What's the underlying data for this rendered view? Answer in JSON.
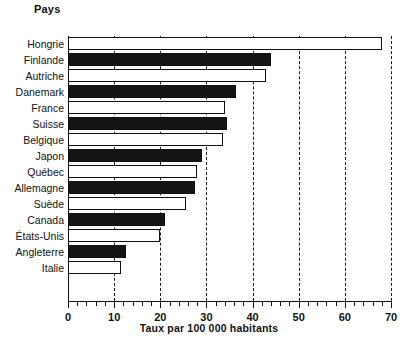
{
  "figure": {
    "category_axis_title": "Pays",
    "value_axis_caption": "Taux par 100 000 habitants"
  },
  "chart_data": {
    "type": "bar",
    "orientation": "horizontal",
    "title": "",
    "xlabel": "Taux par 100 000 habitants",
    "ylabel": "Pays",
    "xlim": [
      0,
      70
    ],
    "xticks": [
      0,
      10,
      20,
      30,
      40,
      50,
      60,
      70
    ],
    "xtick_labels": [
      "0",
      "10",
      "20",
      "30",
      "40",
      "50",
      "60",
      "70"
    ],
    "minor_tick_step": 2,
    "grid": "vertical dashed gridlines at 10, 20, 30, 40, 50, 60, 70",
    "legend": "none",
    "categories": [
      "Hongrie",
      "Finlande",
      "Autriche",
      "Danemark",
      "France",
      "Suisse",
      "Belgique",
      "Japon",
      "Québec",
      "Allemagne",
      "Suède",
      "Canada",
      "États-Unis",
      "Angleterre",
      "Italie"
    ],
    "values": [
      68,
      44,
      43,
      36.5,
      34,
      34.5,
      33.5,
      29,
      28,
      27.5,
      25.5,
      21,
      20,
      12.5,
      11.5
    ],
    "bar_fills": [
      "white",
      "black",
      "white",
      "black",
      "white",
      "black",
      "white",
      "black",
      "white",
      "black",
      "white",
      "black",
      "white",
      "black",
      "white"
    ],
    "colors": {
      "black_bar": "#141414",
      "white_bar": "#ffffff",
      "outline": "#111111",
      "gridline": "#1a1a1a",
      "background": "#ffffff"
    }
  }
}
